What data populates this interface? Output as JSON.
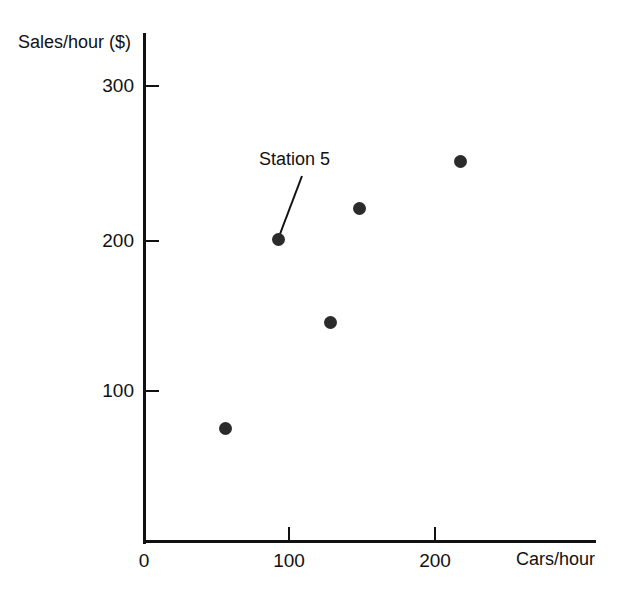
{
  "chart_data": {
    "type": "scatter",
    "title": "",
    "xlabel": "Cars/hour",
    "ylabel": "Sales/hour ($)",
    "xlim": [
      0,
      240
    ],
    "ylim": [
      0,
      330
    ],
    "xticks": [
      "0",
      "100",
      "200"
    ],
    "xtick_values": [
      0,
      100,
      200
    ],
    "yticks": [
      "100",
      "200",
      "300"
    ],
    "ytick_values": [
      100,
      200,
      300
    ],
    "grid": false,
    "legend": null,
    "series": [
      {
        "name": "Stations",
        "points": [
          {
            "x": 57,
            "y": 75
          },
          {
            "x": 93,
            "y": 199,
            "label": "Station 5"
          },
          {
            "x": 129,
            "y": 144
          },
          {
            "x": 149,
            "y": 219
          },
          {
            "x": 218,
            "y": 250
          }
        ]
      }
    ],
    "annotations": [
      {
        "text": "Station 5",
        "target_x": 93,
        "target_y": 199
      }
    ],
    "colors": {
      "marker": "#2b2b2b",
      "axis": "#111111",
      "text": "#111111",
      "background": "#ffffff"
    }
  },
  "axes": {
    "y_title": "Sales/hour ($)",
    "x_title": "Cars/hour",
    "y_tick_labels": [
      "300",
      "200",
      "100"
    ],
    "x_tick_labels": [
      "0",
      "100",
      "200"
    ]
  },
  "annotation": {
    "station_label": "Station 5"
  },
  "header": {
    "clipped_text": ""
  }
}
